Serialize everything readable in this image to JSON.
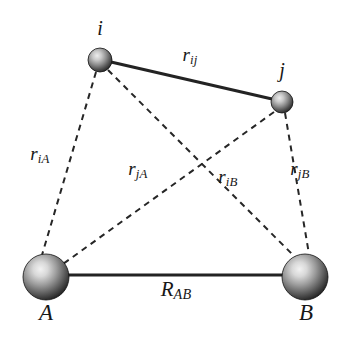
{
  "figure": {
    "background_color": "#ffffff",
    "line_color": "#232323",
    "label_color": "#171717"
  },
  "nodes": [
    {
      "id": "i",
      "label": "i",
      "kind": "small-sphere",
      "cx": 100,
      "cy": 60,
      "r": 12,
      "label_x": 100,
      "label_y": 28
    },
    {
      "id": "j",
      "label": "j",
      "kind": "small-sphere",
      "cx": 282,
      "cy": 102,
      "r": 11,
      "label_x": 282,
      "label_y": 70
    },
    {
      "id": "A",
      "label": "A",
      "kind": "large-sphere",
      "cx": 46,
      "cy": 277,
      "r": 23,
      "label_x": 46,
      "label_y": 312
    },
    {
      "id": "B",
      "label": "B",
      "kind": "large-sphere",
      "cx": 305,
      "cy": 277,
      "r": 23,
      "label_x": 306,
      "label_y": 312
    }
  ],
  "edges": [
    {
      "id": "ij",
      "from": "i",
      "to": "j",
      "style": "solid",
      "label_base": "r",
      "label_sub": "ij",
      "label_x": 190,
      "label_y": 56
    },
    {
      "id": "AB",
      "from": "A",
      "to": "B",
      "style": "solid",
      "label_base": "R",
      "label_sub": "AB",
      "label_x": 176,
      "label_y": 290
    },
    {
      "id": "iA",
      "from": "i",
      "to": "A",
      "style": "dashed",
      "label_base": "r",
      "label_sub": "iA",
      "label_x": 40,
      "label_y": 155
    },
    {
      "id": "jA",
      "from": "j",
      "to": "A",
      "style": "dashed",
      "label_base": "r",
      "label_sub": "jA",
      "label_x": 138,
      "label_y": 170
    },
    {
      "id": "iB",
      "from": "i",
      "to": "B",
      "style": "dashed",
      "label_base": "r",
      "label_sub": "iB",
      "label_x": 228,
      "label_y": 178
    },
    {
      "id": "jB",
      "from": "j",
      "to": "B",
      "style": "dashed",
      "label_base": "r",
      "label_sub": "jB",
      "label_x": 300,
      "label_y": 170
    }
  ]
}
